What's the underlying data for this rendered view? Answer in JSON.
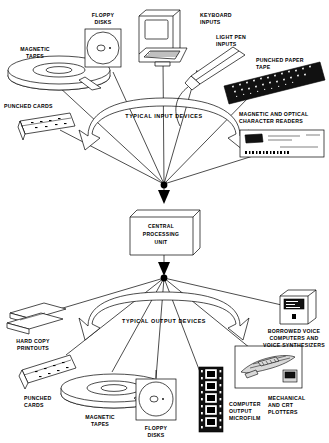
{
  "diagram": {
    "type": "flow-diagram",
    "orientation": "vertical",
    "background_color": "#ffffff",
    "ink_color": "#000000"
  },
  "banners": {
    "input": "TYPICAL  INPUT  DEVICES",
    "output": "TYPICAL OUTPUT DEVICES"
  },
  "cpu": {
    "line1": "CENTRAL",
    "line2": "PROCESSING",
    "line3": "UNIT"
  },
  "input_devices": [
    {
      "id": "magnetic-tapes",
      "label_lines": [
        "MAGNETIC",
        "TAPES"
      ],
      "icon": "tape-reel-icon"
    },
    {
      "id": "floppy-disks",
      "label_lines": [
        "FLOPPY",
        "DISKS"
      ],
      "icon": "floppy-disk-icon"
    },
    {
      "id": "keyboard-inputs",
      "label_lines": [
        "KEYBOARD",
        "INPUTS"
      ],
      "icon": "terminal-icon"
    },
    {
      "id": "light-pen-inputs",
      "label_lines": [
        "LIGHT PEN",
        "INPUTS"
      ],
      "icon": "light-pen-icon"
    },
    {
      "id": "punched-paper-tape",
      "label_lines": [
        "PUNCHED PAPER",
        "TAPE"
      ],
      "icon": "paper-tape-icon"
    },
    {
      "id": "punched-cards",
      "label_lines": [
        "PUNCHED CARDS"
      ],
      "icon": "punched-card-deck-icon"
    },
    {
      "id": "magnetic-optical-character-readers",
      "label_lines": [
        "MAGNETIC AND OPTICAL",
        "CHARACTER READERS"
      ],
      "icon": "check-document-icon"
    }
  ],
  "output_devices": [
    {
      "id": "hard-copy-printouts",
      "label_lines": [
        "HARD COPY",
        "PRINTOUTS"
      ],
      "icon": "printout-sheets-icon"
    },
    {
      "id": "punched-cards-out",
      "label_lines": [
        "PUNCHED",
        "CARDS"
      ],
      "icon": "punched-card-deck-icon"
    },
    {
      "id": "magnetic-tapes-out",
      "label_lines": [
        "MAGNETIC",
        "TAPES"
      ],
      "icon": "tape-reel-icon"
    },
    {
      "id": "floppy-disks-out",
      "label_lines": [
        "FLOPPY",
        "DISKS"
      ],
      "icon": "floppy-disk-icon"
    },
    {
      "id": "computer-output-microfilm",
      "label_lines": [
        "COMPUTER",
        "OUTPUT",
        "MICROFILM"
      ],
      "icon": "microfilm-strip-icon"
    },
    {
      "id": "mechanical-crt-plotters",
      "label_lines": [
        "MECHANICAL",
        "AND CRT",
        "PLOTTERS"
      ],
      "icon": "plotter-drawing-icon"
    },
    {
      "id": "borrowed-voice",
      "label_lines": [
        "BORROWED VOICE",
        "COMPUTERS AND",
        "VOICE SYNTHESIZERS"
      ],
      "icon": "voice-box-icon"
    }
  ]
}
